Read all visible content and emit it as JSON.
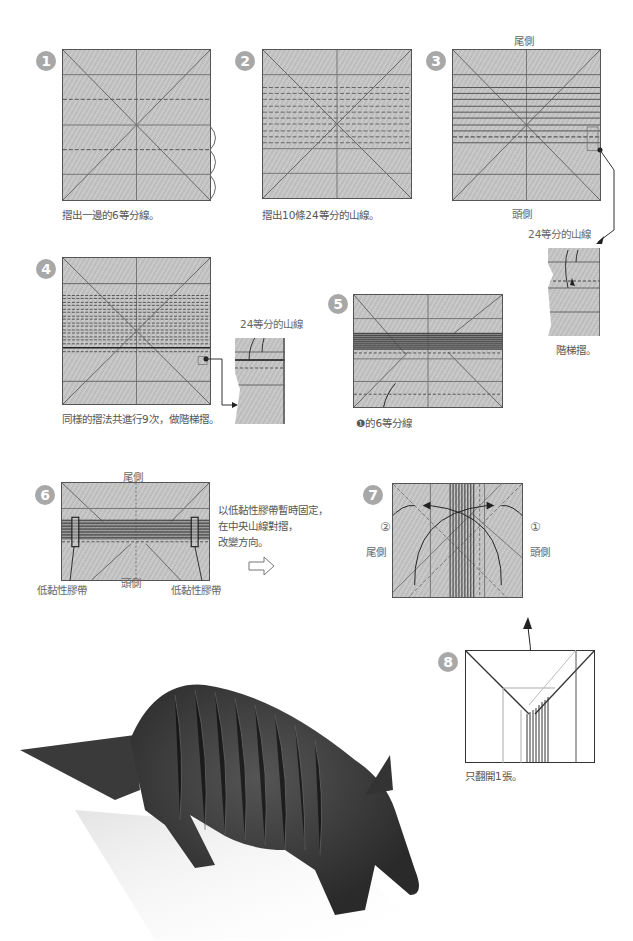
{
  "steps": [
    {
      "number": "1",
      "caption": "摺出一邊的6等分線。"
    },
    {
      "number": "2",
      "caption": "摺出10條24等分的山線。"
    },
    {
      "number": "3",
      "top_label": "尾側",
      "bottom_label": "頭側",
      "callout": "24等分的山線",
      "detail_caption": "階梯摺。"
    },
    {
      "number": "4",
      "caption": "同樣的摺法共進行9次，做階梯摺。",
      "callout": "24等分的山線"
    },
    {
      "number": "5",
      "caption": "❶的6等分線"
    },
    {
      "number": "6",
      "top_label": "尾側",
      "bottom_label": "頭側",
      "tape_left": "低黏性膠帶",
      "tape_right": "低黏性膠帶",
      "instruction_lines": [
        "以低黏性膠帶暫時固定，",
        "在中央山線對摺，",
        "改變方向。"
      ]
    },
    {
      "number": "7",
      "left_label": "尾側",
      "right_label": "頭側",
      "marker_left": "②",
      "marker_right": "①"
    },
    {
      "number": "8",
      "caption": "只翻開1張。"
    }
  ],
  "photo": {
    "subject": "origami armadillo"
  },
  "colors": {
    "badge": "#a8a8a8",
    "paper": "#c4c4c4",
    "line": "#555555"
  }
}
